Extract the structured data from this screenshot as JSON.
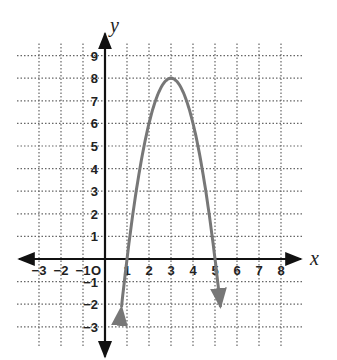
{
  "chart_data": {
    "type": "line",
    "title": "",
    "xlabel": "x",
    "ylabel": "y",
    "xlim": [
      -3,
      8
    ],
    "ylim": [
      -3,
      9
    ],
    "grid": true,
    "grid_style": "dotted",
    "x_ticks": [
      "-3",
      "-2",
      "-1",
      "O",
      "1",
      "2",
      "3",
      "4",
      "5",
      "6",
      "7",
      "8"
    ],
    "y_ticks": [
      "-3",
      "-2",
      "-1",
      "1",
      "2",
      "3",
      "4",
      "5",
      "6",
      "7",
      "8",
      "9"
    ],
    "origin_label": "O",
    "series": [
      {
        "name": "parabola",
        "equation": "y = -2(x - 3)^2 + 8",
        "vertex": [
          3,
          8
        ],
        "x_intercepts": [
          1,
          5
        ],
        "x": [
          0.75,
          1,
          1.5,
          2,
          2.5,
          3,
          3.5,
          4,
          4.5,
          5,
          5.25
        ],
        "values": [
          -2.125,
          0,
          3.5,
          6,
          7.5,
          8,
          7.5,
          6,
          3.5,
          0,
          -2.125
        ],
        "color": "#777777",
        "arrows_at_ends": true
      }
    ]
  }
}
